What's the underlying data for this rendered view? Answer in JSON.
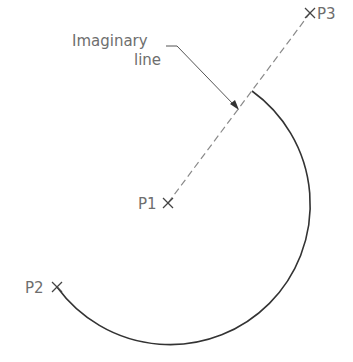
{
  "diagram": {
    "type": "arc-construction",
    "colors": {
      "arc": "#333333",
      "dashed_line": "#8a8a8a",
      "leader": "#555555",
      "text": "#6e6e6e",
      "background": "#ffffff"
    },
    "points": [
      {
        "id": "P1",
        "label": "P1",
        "role": "center",
        "x": 168,
        "y": 203
      },
      {
        "id": "P2",
        "label": "P2",
        "role": "start",
        "x": 57,
        "y": 287
      },
      {
        "id": "P3",
        "label": "P3",
        "role": "end-direction",
        "x": 310,
        "y": 13
      }
    ],
    "arc": {
      "center": "P1",
      "radius": 140
    },
    "annotation": {
      "line1": "Imaginary",
      "line2": "line"
    }
  }
}
